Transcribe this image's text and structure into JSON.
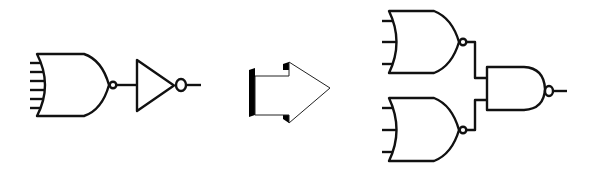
{
  "diagram": {
    "title": "NOR-with-inverter equivalent to NOR-NOR-NAND expansion",
    "colors": {
      "stroke": "#111111",
      "background": "#ffffff",
      "arrow_shadow": "#000000"
    },
    "left": {
      "gates": [
        {
          "type": "NOR",
          "inputs": 6,
          "label": "6-input NOR gate"
        },
        {
          "type": "NOT",
          "inputs": 1,
          "label": "inverter"
        }
      ]
    },
    "arrow": {
      "direction": "right",
      "label": "transforms into"
    },
    "right": {
      "gates": [
        {
          "type": "NOR",
          "inputs": 3,
          "label": "top 3-input NOR gate"
        },
        {
          "type": "NOR",
          "inputs": 3,
          "label": "bottom 3-input NOR gate"
        },
        {
          "type": "NAND",
          "inputs": 2,
          "label": "2-input NAND gate"
        }
      ]
    }
  }
}
